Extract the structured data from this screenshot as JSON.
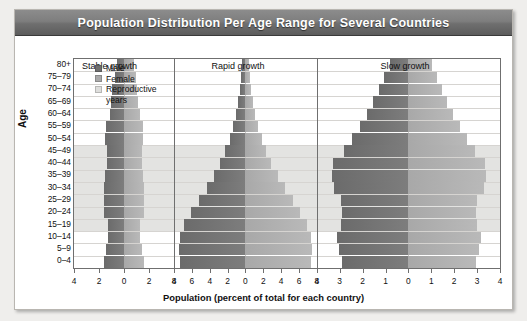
{
  "title": "Population Distribution Per Age Range for Several Countries",
  "axis": {
    "y_label": "Age",
    "x_label": "Population (percent of total for each country)"
  },
  "legend": {
    "items": [
      {
        "label": "Male",
        "color": "#6e6e6e",
        "swatch": "male-swatch"
      },
      {
        "label": "Female",
        "color": "#a9a9a9",
        "swatch": "female-swatch"
      },
      {
        "label": "Reproductive",
        "color": "#dededc",
        "swatch": "reproductive-swatch"
      }
    ],
    "continuation": "years"
  },
  "chart_data": {
    "type": "bar",
    "title": "Population Distribution Per Age Range for Several Countries",
    "xlabel": "Population (percent of total for each country)",
    "ylabel": "Age",
    "grid": true,
    "legend_position": "inside-top-left",
    "categories": [
      "80+",
      "75–79",
      "70–74",
      "65–69",
      "60–64",
      "55–59",
      "50–54",
      "45–49",
      "40–44",
      "35–39",
      "30–34",
      "25–29",
      "20–24",
      "15–19",
      "10–14",
      "5–9",
      "0–4"
    ],
    "reproductive_years_range": [
      "15–19",
      "45–49"
    ],
    "panels": [
      {
        "name": "Stable growth",
        "xlim": [
          4,
          4
        ],
        "xticks": [
          4,
          2,
          0,
          2,
          4
        ],
        "series": [
          {
            "name": "Male",
            "values": [
              0.55,
              0.75,
              0.95,
              1.05,
              1.15,
              1.45,
              1.55,
              1.35,
              1.35,
              1.55,
              1.6,
              1.6,
              1.6,
              1.25,
              1.25,
              1.45,
              1.6
            ]
          },
          {
            "name": "Female",
            "values": [
              0.8,
              0.95,
              1.05,
              1.15,
              1.25,
              1.5,
              1.55,
              1.4,
              1.4,
              1.55,
              1.6,
              1.6,
              1.6,
              1.3,
              1.3,
              1.45,
              1.6
            ]
          }
        ]
      },
      {
        "name": "Rapid growth",
        "xlim": [
          8,
          8
        ],
        "xticks": [
          8,
          6,
          4,
          2,
          0,
          2,
          4,
          6,
          8
        ],
        "series": [
          {
            "name": "Male",
            "values": [
              0.35,
              0.45,
              0.6,
              0.8,
              1.05,
              1.35,
              1.75,
              2.25,
              2.85,
              3.55,
              4.35,
              5.25,
              6.1,
              6.85,
              7.35,
              7.45,
              7.3
            ]
          },
          {
            "name": "Female",
            "values": [
              0.4,
              0.5,
              0.65,
              0.85,
              1.1,
              1.4,
              1.8,
              2.3,
              2.9,
              3.6,
              4.4,
              5.3,
              6.15,
              6.9,
              7.4,
              7.5,
              7.35
            ]
          }
        ]
      },
      {
        "name": "Slow growth",
        "xlim": [
          4,
          4
        ],
        "xticks": [
          4,
          3,
          2,
          1,
          0,
          1,
          2,
          3,
          4
        ],
        "series": [
          {
            "name": "Male",
            "values": [
              0.8,
              1.05,
              1.3,
              1.55,
              1.8,
              2.1,
              2.45,
              2.8,
              3.3,
              3.35,
              3.25,
              2.95,
              2.9,
              2.95,
              3.1,
              3.05,
              2.9
            ]
          },
          {
            "name": "Female",
            "values": [
              1.05,
              1.25,
              1.45,
              1.7,
              1.95,
              2.25,
              2.55,
              2.9,
              3.35,
              3.4,
              3.3,
              3.0,
              2.95,
              3.0,
              3.15,
              3.1,
              2.95
            ]
          }
        ]
      }
    ]
  }
}
